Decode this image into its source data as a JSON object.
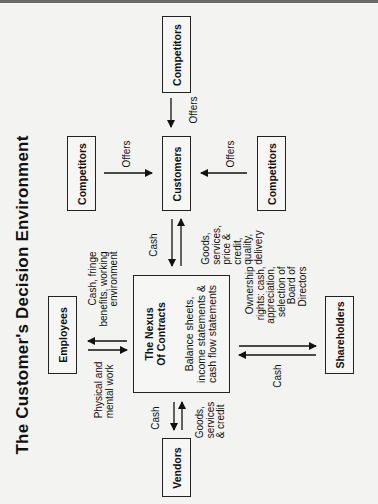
{
  "title": "The Customer's Decision Environment",
  "nodes": {
    "competitors_top": "Competitors",
    "customers": "Customers",
    "competitors_left": "Competitors",
    "competitors_right": "Competitors",
    "nexus_title_1": "The Nexus",
    "nexus_title_2": "Of Contracts",
    "nexus_sub_1": "Balance sheets,",
    "nexus_sub_2": "income statements &",
    "nexus_sub_3": "cash flow statements",
    "employees": "Employees",
    "shareholders": "Shareholders",
    "vendors": "Vendors"
  },
  "edges": {
    "offers_top": "Offers",
    "offers_left": "Offers",
    "offers_right": "Offers",
    "cust_cash": "Cash",
    "cust_goods_1": "Goods,",
    "cust_goods_2": "services,",
    "cust_goods_3": "price &",
    "cust_goods_4": "credit,",
    "cust_goods_5": "quality,",
    "cust_goods_6": "delivery",
    "emp_cash_1": "Cash, fringe",
    "emp_cash_2": "benefits, working",
    "emp_cash_3": "environment",
    "emp_work_1": "Physical and",
    "emp_work_2": "mental work",
    "sh_own_1": "Ownership",
    "sh_own_2": "rights: cash,",
    "sh_own_3": "appreciation,",
    "sh_own_4": "selection of",
    "sh_own_5": "Board of",
    "sh_own_6": "Directors",
    "sh_cash": "Cash",
    "ven_cash": "Cash",
    "ven_goods_1": "Goods,",
    "ven_goods_2": "services",
    "ven_goods_3": "& credit"
  }
}
